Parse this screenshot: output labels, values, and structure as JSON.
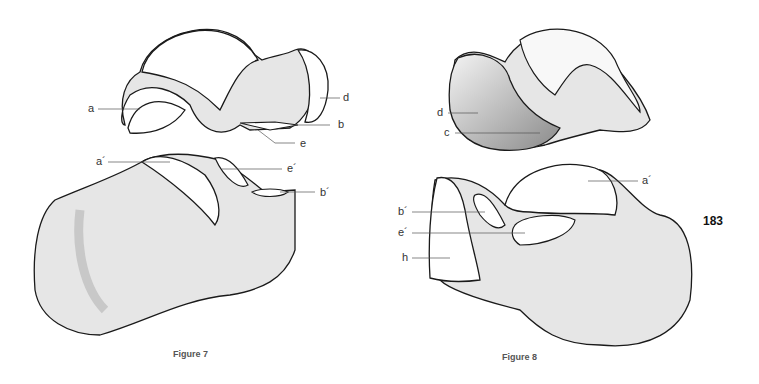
{
  "page": {
    "number": "183"
  },
  "figure7": {
    "caption": "Figure 7",
    "labels": {
      "a": "a",
      "d": "d",
      "b": "b",
      "e": "e",
      "a_prime": "a´",
      "e_prime": "e´",
      "b_prime": "b´"
    }
  },
  "figure8": {
    "caption": "Figure 8",
    "labels": {
      "d": "d",
      "c": "c",
      "a_prime": "a´",
      "b_prime": "b´",
      "e_prime": "e´",
      "h": "h"
    }
  },
  "colors": {
    "bone_fill": "#e6e6e6",
    "shadow": "#c8c8c8",
    "outline": "#1a1a1a",
    "articular": "#ffffff"
  }
}
